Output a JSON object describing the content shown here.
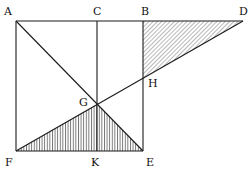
{
  "diagram": {
    "type": "geometric-figure",
    "points": {
      "A": [
        16,
        21
      ],
      "C": [
        97,
        21
      ],
      "B": [
        143,
        21
      ],
      "D": [
        243,
        21
      ],
      "F": [
        16,
        151
      ],
      "K": [
        97,
        151
      ],
      "E": [
        143,
        151
      ],
      "G": [
        97,
        104
      ],
      "H": [
        143,
        78
      ]
    },
    "labels": [
      {
        "text": "A",
        "x": 4,
        "y": 6
      },
      {
        "text": "C",
        "x": 93,
        "y": 6
      },
      {
        "text": "B",
        "x": 141,
        "y": 6
      },
      {
        "text": "D",
        "x": 239,
        "y": 6
      },
      {
        "text": "H",
        "x": 148,
        "y": 78
      },
      {
        "text": "G",
        "x": 79,
        "y": 97
      },
      {
        "text": "F",
        "x": 5,
        "y": 157
      },
      {
        "text": "K",
        "x": 91,
        "y": 157
      },
      {
        "text": "E",
        "x": 146,
        "y": 157
      }
    ],
    "segments": [
      "AD",
      "AF",
      "FE",
      "CK",
      "BE",
      "AE",
      "FD"
    ],
    "shaded_regions": [
      {
        "name": "triangle-BDH",
        "pattern": "diagonal-hatch"
      },
      {
        "name": "triangle-FGE",
        "pattern": "vertical-hatch"
      }
    ],
    "stroke_color": "#1a1a1a"
  }
}
